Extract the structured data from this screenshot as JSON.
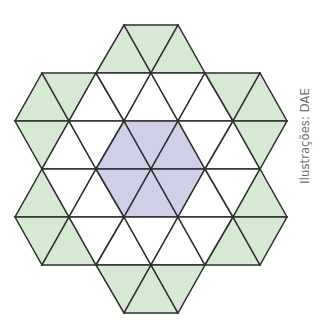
{
  "figure": {
    "credit_label": "Ilustrações: DAE",
    "colors": {
      "green": "#d6ead3",
      "purple": "#cfcfe8",
      "white": "#ffffff",
      "stroke": "#2f2f2f"
    },
    "counts": {
      "purple": 6,
      "white": 18,
      "green": 18,
      "total": 42
    },
    "triangles": [
      {
        "pts": [
          [
            96,
            73
          ],
          [
            151,
            73
          ],
          [
            124,
            25
          ]
        ],
        "fill": "green"
      },
      {
        "pts": [
          [
            124,
            25
          ],
          [
            178,
            25
          ],
          [
            151,
            73
          ]
        ],
        "fill": "green"
      },
      {
        "pts": [
          [
            151,
            73
          ],
          [
            205,
            73
          ],
          [
            178,
            25
          ]
        ],
        "fill": "green"
      },
      {
        "pts": [
          [
            15,
            121
          ],
          [
            69,
            121
          ],
          [
            42,
            73
          ]
        ],
        "fill": "green"
      },
      {
        "pts": [
          [
            42,
            73
          ],
          [
            96,
            73
          ],
          [
            69,
            121
          ]
        ],
        "fill": "green"
      },
      {
        "pts": [
          [
            69,
            121
          ],
          [
            124,
            121
          ],
          [
            96,
            73
          ]
        ],
        "fill": "white"
      },
      {
        "pts": [
          [
            96,
            73
          ],
          [
            151,
            73
          ],
          [
            124,
            121
          ]
        ],
        "fill": "white"
      },
      {
        "pts": [
          [
            124,
            121
          ],
          [
            178,
            121
          ],
          [
            151,
            73
          ]
        ],
        "fill": "white"
      },
      {
        "pts": [
          [
            151,
            73
          ],
          [
            205,
            73
          ],
          [
            178,
            121
          ]
        ],
        "fill": "white"
      },
      {
        "pts": [
          [
            178,
            121
          ],
          [
            233,
            121
          ],
          [
            205,
            73
          ]
        ],
        "fill": "white"
      },
      {
        "pts": [
          [
            205,
            73
          ],
          [
            260,
            73
          ],
          [
            233,
            121
          ]
        ],
        "fill": "green"
      },
      {
        "pts": [
          [
            233,
            121
          ],
          [
            287,
            121
          ],
          [
            260,
            73
          ]
        ],
        "fill": "green"
      },
      {
        "pts": [
          [
            15,
            121
          ],
          [
            69,
            121
          ],
          [
            42,
            169
          ]
        ],
        "fill": "green"
      },
      {
        "pts": [
          [
            42,
            169
          ],
          [
            96,
            169
          ],
          [
            69,
            121
          ]
        ],
        "fill": "white"
      },
      {
        "pts": [
          [
            69,
            121
          ],
          [
            124,
            121
          ],
          [
            96,
            169
          ]
        ],
        "fill": "white"
      },
      {
        "pts": [
          [
            96,
            169
          ],
          [
            151,
            169
          ],
          [
            124,
            121
          ]
        ],
        "fill": "purple"
      },
      {
        "pts": [
          [
            124,
            121
          ],
          [
            178,
            121
          ],
          [
            151,
            169
          ]
        ],
        "fill": "purple"
      },
      {
        "pts": [
          [
            151,
            169
          ],
          [
            205,
            169
          ],
          [
            178,
            121
          ]
        ],
        "fill": "purple"
      },
      {
        "pts": [
          [
            178,
            121
          ],
          [
            233,
            121
          ],
          [
            205,
            169
          ]
        ],
        "fill": "white"
      },
      {
        "pts": [
          [
            205,
            169
          ],
          [
            260,
            169
          ],
          [
            233,
            121
          ]
        ],
        "fill": "white"
      },
      {
        "pts": [
          [
            233,
            121
          ],
          [
            287,
            121
          ],
          [
            260,
            169
          ]
        ],
        "fill": "green"
      },
      {
        "pts": [
          [
            15,
            217
          ],
          [
            69,
            217
          ],
          [
            42,
            169
          ]
        ],
        "fill": "green"
      },
      {
        "pts": [
          [
            42,
            169
          ],
          [
            96,
            169
          ],
          [
            69,
            217
          ]
        ],
        "fill": "white"
      },
      {
        "pts": [
          [
            69,
            217
          ],
          [
            124,
            217
          ],
          [
            96,
            169
          ]
        ],
        "fill": "white"
      },
      {
        "pts": [
          [
            96,
            169
          ],
          [
            151,
            169
          ],
          [
            124,
            217
          ]
        ],
        "fill": "purple"
      },
      {
        "pts": [
          [
            124,
            217
          ],
          [
            178,
            217
          ],
          [
            151,
            169
          ]
        ],
        "fill": "purple"
      },
      {
        "pts": [
          [
            151,
            169
          ],
          [
            205,
            169
          ],
          [
            178,
            217
          ]
        ],
        "fill": "purple"
      },
      {
        "pts": [
          [
            178,
            217
          ],
          [
            233,
            217
          ],
          [
            205,
            169
          ]
        ],
        "fill": "white"
      },
      {
        "pts": [
          [
            205,
            169
          ],
          [
            260,
            169
          ],
          [
            233,
            217
          ]
        ],
        "fill": "white"
      },
      {
        "pts": [
          [
            233,
            217
          ],
          [
            287,
            217
          ],
          [
            260,
            169
          ]
        ],
        "fill": "green"
      },
      {
        "pts": [
          [
            15,
            217
          ],
          [
            69,
            217
          ],
          [
            42,
            265
          ]
        ],
        "fill": "green"
      },
      {
        "pts": [
          [
            42,
            265
          ],
          [
            96,
            265
          ],
          [
            69,
            217
          ]
        ],
        "fill": "green"
      },
      {
        "pts": [
          [
            69,
            217
          ],
          [
            124,
            217
          ],
          [
            96,
            265
          ]
        ],
        "fill": "white"
      },
      {
        "pts": [
          [
            96,
            265
          ],
          [
            151,
            265
          ],
          [
            124,
            217
          ]
        ],
        "fill": "white"
      },
      {
        "pts": [
          [
            124,
            217
          ],
          [
            178,
            217
          ],
          [
            151,
            265
          ]
        ],
        "fill": "white"
      },
      {
        "pts": [
          [
            151,
            265
          ],
          [
            205,
            265
          ],
          [
            178,
            217
          ]
        ],
        "fill": "white"
      },
      {
        "pts": [
          [
            178,
            217
          ],
          [
            233,
            217
          ],
          [
            205,
            265
          ]
        ],
        "fill": "white"
      },
      {
        "pts": [
          [
            205,
            265
          ],
          [
            260,
            265
          ],
          [
            233,
            217
          ]
        ],
        "fill": "green"
      },
      {
        "pts": [
          [
            233,
            217
          ],
          [
            287,
            217
          ],
          [
            260,
            265
          ]
        ],
        "fill": "green"
      },
      {
        "pts": [
          [
            96,
            265
          ],
          [
            151,
            265
          ],
          [
            124,
            313
          ]
        ],
        "fill": "green"
      },
      {
        "pts": [
          [
            124,
            313
          ],
          [
            178,
            313
          ],
          [
            151,
            265
          ]
        ],
        "fill": "green"
      },
      {
        "pts": [
          [
            151,
            265
          ],
          [
            205,
            265
          ],
          [
            178,
            313
          ]
        ],
        "fill": "green"
      }
    ]
  }
}
